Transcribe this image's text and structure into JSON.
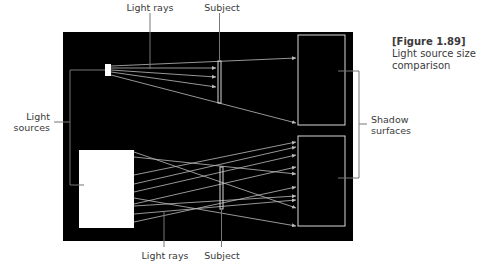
{
  "caption": {
    "figure": "[Figure 1.89]",
    "line1": "Light source size",
    "line2": "comparison"
  },
  "labels": {
    "light_rays_top": "Light rays",
    "subject_top": "Subject",
    "light_sources_1": "Light",
    "light_sources_2": "sources",
    "shadow_surfaces_1": "Shadow",
    "shadow_surfaces_2": "surfaces",
    "light_rays_bottom": "Light rays",
    "subject_bottom": "Subject"
  },
  "colors": {
    "background": "#ffffff",
    "panel": "#000000",
    "light": "#ffffff",
    "outline": "#d8d8d8",
    "ray": "#bdbdbd",
    "callout": "#555555",
    "text": "#3a3a3a"
  },
  "geometry": {
    "panel": {
      "x": 63,
      "y": 32,
      "w": 290,
      "h": 209
    },
    "small_light": {
      "x": 105,
      "y": 64,
      "w": 6,
      "h": 12
    },
    "large_light": {
      "x": 79,
      "y": 150,
      "w": 55,
      "h": 78
    },
    "subject_top": {
      "x": 218,
      "y": 61,
      "w": 3,
      "h": 42
    },
    "subject_bottom": {
      "x": 220,
      "y": 167,
      "w": 3,
      "h": 42
    },
    "shadow_top": {
      "x": 298,
      "y": 35,
      "w": 47,
      "h": 90
    },
    "shadow_bottom": {
      "x": 298,
      "y": 136,
      "w": 47,
      "h": 90
    }
  },
  "rays_top": [
    [
      111,
      66,
      296,
      58
    ],
    [
      111,
      68,
      216,
      68
    ],
    [
      111,
      70,
      216,
      77
    ],
    [
      111,
      72,
      216,
      87
    ],
    [
      111,
      75,
      296,
      123
    ]
  ],
  "rays_bottom": [
    [
      134,
      152,
      296,
      208
    ],
    [
      134,
      175,
      296,
      142
    ],
    [
      134,
      184,
      296,
      147
    ],
    [
      134,
      192,
      296,
      155
    ],
    [
      134,
      198,
      296,
      226
    ],
    [
      134,
      206,
      296,
      196
    ],
    [
      134,
      214,
      296,
      200
    ],
    [
      134,
      222,
      296,
      187
    ],
    [
      134,
      204,
      296,
      167
    ],
    [
      134,
      157,
      296,
      174
    ]
  ]
}
